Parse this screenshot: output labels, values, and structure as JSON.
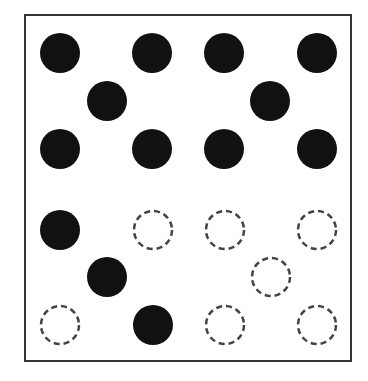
{
  "diagram": {
    "type": "dot-pattern-grid",
    "layout": "2x2 quadrants, each a five-dot quincunx",
    "colors": {
      "filled": "#111111",
      "outline": "#444444",
      "border": "#333333"
    },
    "radius": 20,
    "dots": [
      {
        "quadrant": "top-left",
        "x": 60,
        "y": 53,
        "style": "filled"
      },
      {
        "quadrant": "top-left",
        "x": 152,
        "y": 53,
        "style": "filled"
      },
      {
        "quadrant": "top-left",
        "x": 107,
        "y": 101,
        "style": "filled"
      },
      {
        "quadrant": "top-left",
        "x": 60,
        "y": 149,
        "style": "filled"
      },
      {
        "quadrant": "top-left",
        "x": 152,
        "y": 149,
        "style": "filled"
      },
      {
        "quadrant": "top-right",
        "x": 224,
        "y": 53,
        "style": "filled"
      },
      {
        "quadrant": "top-right",
        "x": 317,
        "y": 53,
        "style": "filled"
      },
      {
        "quadrant": "top-right",
        "x": 270,
        "y": 101,
        "style": "filled"
      },
      {
        "quadrant": "top-right",
        "x": 224,
        "y": 149,
        "style": "filled"
      },
      {
        "quadrant": "top-right",
        "x": 317,
        "y": 149,
        "style": "filled"
      },
      {
        "quadrant": "bottom-left",
        "x": 60,
        "y": 230,
        "style": "filled"
      },
      {
        "quadrant": "bottom-left",
        "x": 153,
        "y": 230,
        "style": "dashed"
      },
      {
        "quadrant": "bottom-left",
        "x": 107,
        "y": 277,
        "style": "filled"
      },
      {
        "quadrant": "bottom-left",
        "x": 60,
        "y": 325,
        "style": "dashed"
      },
      {
        "quadrant": "bottom-left",
        "x": 153,
        "y": 325,
        "style": "filled"
      },
      {
        "quadrant": "bottom-right",
        "x": 225,
        "y": 230,
        "style": "dashed"
      },
      {
        "quadrant": "bottom-right",
        "x": 317,
        "y": 230,
        "style": "dashed"
      },
      {
        "quadrant": "bottom-right",
        "x": 271,
        "y": 277,
        "style": "dashed"
      },
      {
        "quadrant": "bottom-right",
        "x": 225,
        "y": 325,
        "style": "dashed"
      },
      {
        "quadrant": "bottom-right",
        "x": 317,
        "y": 325,
        "style": "dashed"
      }
    ],
    "counts": {
      "filled": 13,
      "dashed": 7,
      "total": 20
    }
  }
}
